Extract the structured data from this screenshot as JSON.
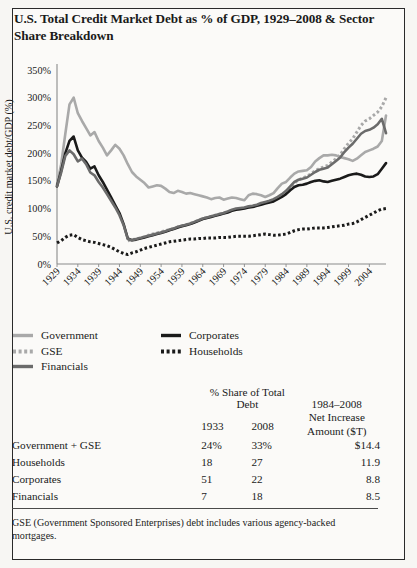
{
  "title": "U.S. Total Credit Market Debt as % of GDP, 1929–2008 & Sector Share Breakdown",
  "colors": {
    "light_gray": "#a9a9a9",
    "mid_gray": "#6b6b6b",
    "black": "#1a1a1a",
    "frame": "#2a2a2a",
    "page_bg": "#fbfaf8"
  },
  "legend": {
    "items": [
      {
        "label": "Government",
        "style": "solid",
        "color": "#a9a9a9",
        "column": 0,
        "row": 0
      },
      {
        "label": "Corporates",
        "style": "solid",
        "color": "#1a1a1a",
        "column": 1,
        "row": 0
      },
      {
        "label": "GSE",
        "style": "dotted",
        "color": "#a9a9a9",
        "column": 0,
        "row": 1
      },
      {
        "label": "Households",
        "style": "dotted",
        "color": "#1a1a1a",
        "column": 1,
        "row": 1
      },
      {
        "label": "Financials",
        "style": "solid",
        "color": "#6b6b6b",
        "column": 0,
        "row": 2
      }
    ]
  },
  "table": {
    "header_share": "% Share of Total Debt",
    "header_net": "1984–2008\nNet Increase\nAmount ($T)",
    "col_1933": "1933",
    "col_2008": "2008",
    "rows": [
      {
        "label": "Government + GSE",
        "v1933": "24%",
        "v2008": "33%",
        "net": "$14.4"
      },
      {
        "label": "Households",
        "v1933": "18",
        "v2008": "27",
        "net": "11.9"
      },
      {
        "label": "Corporates",
        "v1933": "51",
        "v2008": "22",
        "net": "8.8"
      },
      {
        "label": "Financials",
        "v1933": "7",
        "v2008": "18",
        "net": "8.5"
      }
    ]
  },
  "footnote": "GSE (Government Sponsored Enterprises) debt includes various agency-backed mortgages.",
  "chart_data": {
    "type": "line",
    "title": "",
    "xlabel": "",
    "ylabel": "U.S. credit market debt/GDP (%)",
    "ylim": [
      0,
      350
    ],
    "yticks": [
      0,
      50,
      100,
      150,
      200,
      250,
      300,
      350
    ],
    "ytick_labels": [
      "0%",
      "50%",
      "100%",
      "150%",
      "200%",
      "250%",
      "300%",
      "350%"
    ],
    "xlim": [
      1929,
      2008
    ],
    "xticks": [
      1929,
      1934,
      1939,
      1944,
      1949,
      1954,
      1959,
      1964,
      1969,
      1974,
      1979,
      1984,
      1989,
      1994,
      1999,
      2004
    ],
    "xtick_labels": [
      "1929",
      "1934",
      "1939",
      "1944",
      "1949",
      "1954",
      "1959",
      "1964",
      "1969",
      "1974",
      "1979",
      "1984",
      "1989",
      "1994",
      "1999",
      "2004"
    ],
    "xtick_rotation": 45,
    "grid": false,
    "legend_position": "below",
    "x": [
      1929,
      1930,
      1931,
      1932,
      1933,
      1934,
      1935,
      1936,
      1937,
      1938,
      1939,
      1940,
      1941,
      1942,
      1943,
      1944,
      1945,
      1946,
      1947,
      1948,
      1949,
      1950,
      1951,
      1952,
      1953,
      1954,
      1955,
      1956,
      1957,
      1958,
      1959,
      1960,
      1961,
      1962,
      1963,
      1964,
      1965,
      1966,
      1967,
      1968,
      1969,
      1970,
      1971,
      1972,
      1973,
      1974,
      1975,
      1976,
      1977,
      1978,
      1979,
      1980,
      1981,
      1982,
      1983,
      1984,
      1985,
      1986,
      1987,
      1988,
      1989,
      1990,
      1991,
      1992,
      1993,
      1994,
      1995,
      1996,
      1997,
      1998,
      1999,
      2000,
      2001,
      2002,
      2003,
      2004,
      2005,
      2006,
      2007,
      2008
    ],
    "series": [
      {
        "name": "Government",
        "color": "#a9a9a9",
        "style": "solid",
        "values": [
          143,
          180,
          235,
          288,
          300,
          272,
          258,
          245,
          232,
          238,
          222,
          210,
          196,
          205,
          215,
          208,
          196,
          180,
          166,
          158,
          152,
          146,
          138,
          140,
          142,
          141,
          136,
          130,
          128,
          132,
          130,
          127,
          128,
          126,
          124,
          122,
          120,
          117,
          119,
          120,
          116,
          118,
          120,
          119,
          117,
          115,
          124,
          127,
          126,
          124,
          121,
          124,
          128,
          137,
          145,
          148,
          156,
          163,
          167,
          168,
          169,
          175,
          185,
          191,
          196,
          196,
          197,
          196,
          193,
          191,
          189,
          186,
          190,
          196,
          202,
          205,
          208,
          212,
          222,
          268
        ]
      },
      {
        "name": "GSE",
        "color": "#a9a9a9",
        "style": "dotted",
        "values": [
          null,
          null,
          null,
          null,
          null,
          null,
          null,
          null,
          null,
          null,
          null,
          null,
          null,
          null,
          null,
          null,
          null,
          42,
          44,
          45,
          47,
          49,
          52,
          54,
          56,
          58,
          60,
          62,
          64,
          67,
          69,
          71,
          73,
          76,
          79,
          82,
          84,
          86,
          88,
          90,
          92,
          94,
          97,
          99,
          100,
          101,
          103,
          104,
          106,
          108,
          110,
          112,
          114,
          118,
          123,
          128,
          137,
          146,
          152,
          155,
          158,
          163,
          168,
          172,
          175,
          178,
          184,
          190,
          197,
          208,
          218,
          226,
          238,
          250,
          258,
          262,
          268,
          274,
          284,
          300
        ]
      },
      {
        "name": "Corporates",
        "color": "#1a1a1a",
        "style": "solid",
        "values": [
          140,
          168,
          200,
          222,
          230,
          205,
          192,
          184,
          172,
          176,
          160,
          148,
          134,
          120,
          106,
          92,
          72,
          46,
          43,
          44,
          46,
          48,
          50,
          52,
          54,
          56,
          58,
          61,
          63,
          66,
          68,
          70,
          72,
          75,
          78,
          81,
          83,
          85,
          87,
          89,
          91,
          93,
          96,
          98,
          99,
          100,
          102,
          103,
          105,
          107,
          109,
          111,
          113,
          117,
          121,
          126,
          133,
          139,
          142,
          143,
          145,
          148,
          150,
          151,
          149,
          148,
          150,
          152,
          154,
          157,
          160,
          162,
          163,
          161,
          158,
          157,
          158,
          162,
          172,
          182
        ]
      },
      {
        "name": "Financials",
        "color": "#6b6b6b",
        "style": "solid",
        "values": [
          140,
          165,
          195,
          205,
          198,
          185,
          190,
          180,
          165,
          160,
          148,
          138,
          126,
          114,
          102,
          88,
          70,
          45,
          43,
          45,
          47,
          49,
          51,
          53,
          55,
          57,
          59,
          62,
          64,
          67,
          69,
          71,
          73,
          76,
          79,
          82,
          84,
          86,
          88,
          90,
          92,
          95,
          98,
          100,
          101,
          102,
          104,
          105,
          107,
          110,
          112,
          114,
          117,
          121,
          126,
          132,
          140,
          148,
          152,
          154,
          156,
          161,
          166,
          170,
          172,
          174,
          180,
          186,
          192,
          202,
          210,
          217,
          226,
          235,
          240,
          242,
          246,
          252,
          262,
          236
        ]
      },
      {
        "name": "Households",
        "color": "#1a1a1a",
        "style": "dotted",
        "values": [
          38,
          42,
          48,
          52,
          53,
          48,
          44,
          42,
          40,
          39,
          37,
          35,
          33,
          30,
          26,
          22,
          19,
          17,
          20,
          22,
          25,
          28,
          30,
          32,
          34,
          36,
          38,
          40,
          41,
          42,
          43,
          44,
          45,
          45,
          46,
          46,
          47,
          47,
          47,
          48,
          48,
          48,
          49,
          50,
          50,
          50,
          50,
          51,
          52,
          53,
          54,
          53,
          52,
          52,
          53,
          54,
          57,
          60,
          62,
          63,
          63,
          64,
          65,
          65,
          65,
          66,
          67,
          68,
          69,
          70,
          72,
          73,
          76,
          80,
          84,
          88,
          92,
          96,
          99,
          100
        ]
      }
    ]
  }
}
